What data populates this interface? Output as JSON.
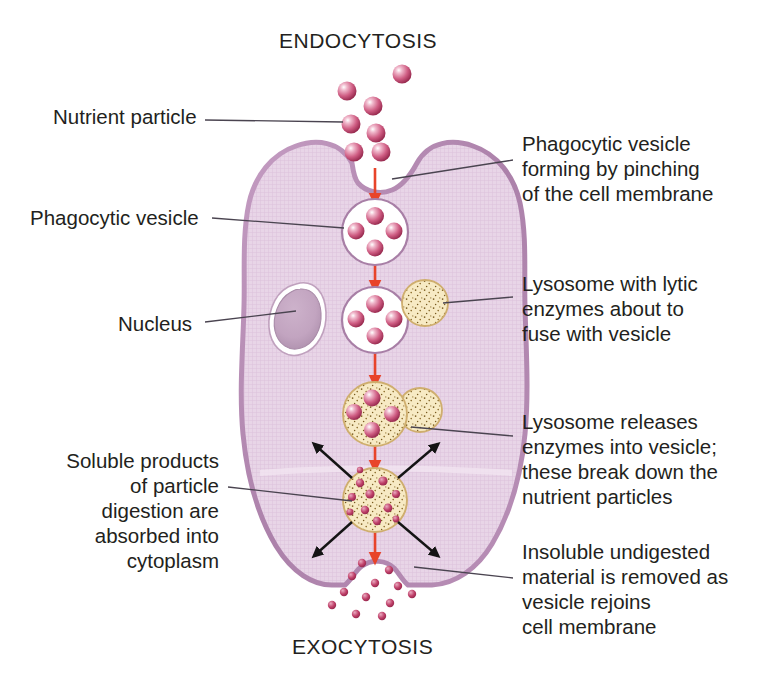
{
  "diagram": {
    "title_top": "ENDOCYTOSIS",
    "title_bottom": "EXOCYTOSIS",
    "labels": {
      "nutrient_particle": "Nutrient particle",
      "phagocytic_vesicle": "Phagocytic vesicle",
      "nucleus": "Nucleus",
      "soluble_products": "Soluble products\nof particle\ndigestion are\nabsorbed into\ncytoplasm",
      "phagocytic_forming": "Phagocytic vesicle\nforming by pinching\nof the cell membrane",
      "lysosome_lytic": "Lysosome with lytic\nenzymes about to\nfuse with vesicle",
      "lysosome_releases": "Lysosome releases\nenzymes into vesicle;\nthese break down the\nnutrient particles",
      "insoluble_material": "Insoluble undigested\nmaterial is removed as\nvesicle rejoins\ncell membrane"
    },
    "colors": {
      "background": "#ffffff",
      "cytoplasm": "#e6d2e4",
      "cell_membrane": "#b289b0",
      "nucleus_fill": "#c3a6c1",
      "nucleus_ring": "#ffffff",
      "vesicle_fill": "#ffffff",
      "vesicle_stroke": "#a87fa6",
      "lysosome_fill": "#f6e8c0",
      "lysosome_stroke": "#cfae6e",
      "lysosome_speckle": "#8a6a2a",
      "particle_dark": "#a32c52",
      "particle_light": "#e6809f",
      "flow_arrow": "#e8442a",
      "diffusion_arrow": "#1a1a1a",
      "leader_line": "#4a4450",
      "text": "#231f20"
    },
    "structures": {
      "cell_membrane_label": "cell membrane outline",
      "nucleus_label": "nucleus",
      "free_lysosome_label": "free lysosome",
      "fusing_lysosome_label": "lysosome fusing with vesicle",
      "digestive_vesicle_label": "digestive vesicle",
      "exocytosis_pocket_label": "exocytosis pocket"
    }
  }
}
